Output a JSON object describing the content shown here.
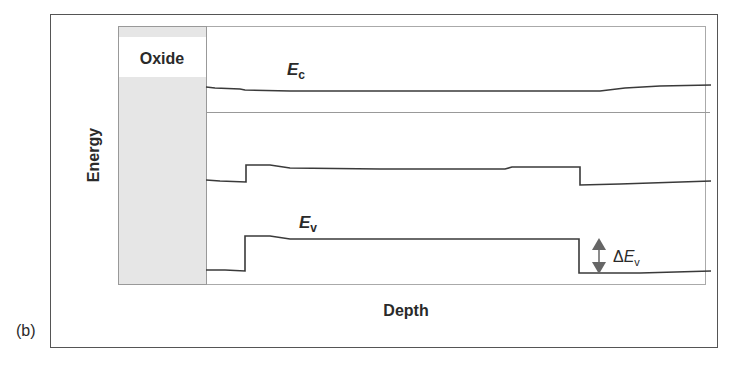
{
  "panel_label": "(b)",
  "axes": {
    "ylabel": "Energy",
    "xlabel": "Depth"
  },
  "regions": {
    "oxide_label": "Oxide"
  },
  "bands": {
    "conduction": {
      "symbol": "E",
      "subscript": "c"
    },
    "valence": {
      "symbol": "E",
      "subscript": "v"
    },
    "offset": {
      "delta": "Δ",
      "symbol": "E",
      "subscript": "v"
    }
  },
  "colors": {
    "line": "#3a3a3a",
    "oxide_fill": "#e6e6e6",
    "frame": "#555555",
    "inner_frame": "#aaaaaa",
    "arrow": "#666666"
  }
}
